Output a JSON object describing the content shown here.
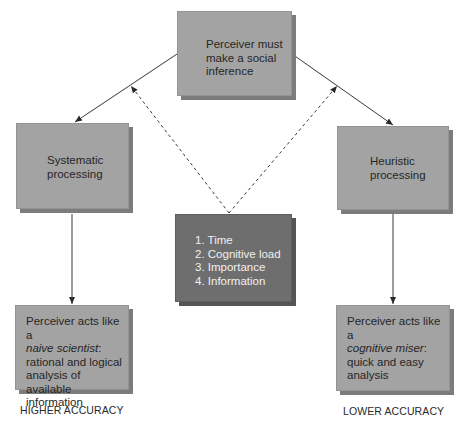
{
  "diagram": {
    "nodes": {
      "top": {
        "lines": [
          "Perceiver must",
          "make a social",
          "inference"
        ]
      },
      "systematic": {
        "lines": [
          "Systematic",
          "processing"
        ]
      },
      "heuristic": {
        "lines": [
          "Heuristic",
          "processing"
        ]
      },
      "factors": {
        "items": [
          "1. Time",
          "2. Cognitive load",
          "3. Importance",
          "4. Information"
        ]
      },
      "naive": {
        "line1": "Perceiver acts like a",
        "italic": "naive scientist",
        "colon": ":",
        "line3": "rational and logical",
        "line4": "analysis of available",
        "line5": "information"
      },
      "miser": {
        "line1": "Perceiver acts like a",
        "italic": "cognitive miser",
        "colon": ":",
        "line3": "quick and easy",
        "line4": "analysis"
      }
    },
    "outcomes": {
      "left": "HIGHER ACCURACY",
      "right": "LOWER ACCURACY"
    },
    "colors": {
      "box": "#a3a3a3",
      "box_dark": "#6e6e6e",
      "arrow": "#3a3a3a"
    }
  }
}
